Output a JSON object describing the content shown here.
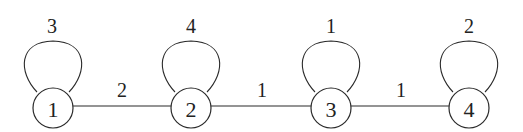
{
  "diagram": {
    "type": "weighted-graph",
    "nodes": [
      {
        "id": "1",
        "label": "1",
        "x": 53,
        "y": 108,
        "loop_weight": "3"
      },
      {
        "id": "2",
        "label": "2",
        "x": 191,
        "y": 108,
        "loop_weight": "4"
      },
      {
        "id": "3",
        "label": "3",
        "x": 331,
        "y": 108,
        "loop_weight": "1"
      },
      {
        "id": "4",
        "label": "4",
        "x": 469,
        "y": 108,
        "loop_weight": "2"
      }
    ],
    "edges": [
      {
        "from": "1",
        "to": "2",
        "weight": "2"
      },
      {
        "from": "2",
        "to": "3",
        "weight": "1"
      },
      {
        "from": "3",
        "to": "4",
        "weight": "1"
      }
    ],
    "style": {
      "stroke_color": "#2a2a2a",
      "node_fill": "#ffffff",
      "background": "#ffffff"
    }
  }
}
